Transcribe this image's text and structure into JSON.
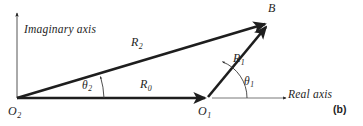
{
  "figure": {
    "caption": "(b)",
    "background_color": "#ffffff",
    "ink_color": "#1e1e1e",
    "type": "vector-loop-diagram"
  },
  "axes": {
    "imaginary": {
      "label": "Imaginary axis",
      "icon": "up-arrow-icon",
      "orientation": "vertical"
    },
    "real": {
      "label": "Real axis",
      "icon": "right-arrow-icon",
      "orientation": "horizontal"
    }
  },
  "points": [
    {
      "id": "o2",
      "name": "O",
      "subscript": "2",
      "x": 17,
      "y": 98
    },
    {
      "id": "o1",
      "name": "O",
      "subscript": "1",
      "x": 207,
      "y": 98
    },
    {
      "id": "b",
      "name": "B",
      "subscript": "",
      "x": 268,
      "y": 22
    }
  ],
  "vectors": [
    {
      "id": "r0",
      "name": "R",
      "subscript": "0",
      "from": "o2",
      "to": "o1",
      "head": "arrow",
      "weight": "thick"
    },
    {
      "id": "r1",
      "name": "R",
      "subscript": "1",
      "from": "o1",
      "to": "b",
      "head": "arrow",
      "weight": "thick"
    },
    {
      "id": "r2",
      "name": "R",
      "subscript": "2",
      "from": "o2",
      "to": "b",
      "head": "arrow",
      "weight": "thick"
    }
  ],
  "angles": [
    {
      "id": "theta1",
      "name": "θ",
      "subscript": "1",
      "vertex": "o1",
      "from_ray": "real-axis-reference",
      "to_ray": "r1",
      "head": "arrow"
    },
    {
      "id": "theta2",
      "name": "θ",
      "subscript": "2",
      "vertex": "o2",
      "from_ray": "real-axis",
      "to_ray": "r2",
      "head": "arrow"
    }
  ]
}
